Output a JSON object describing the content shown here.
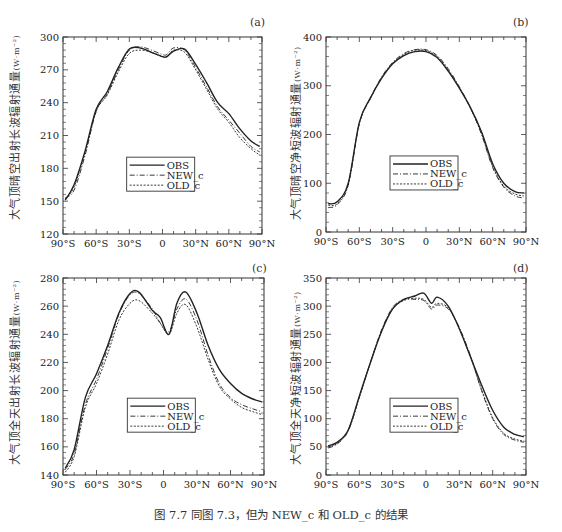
{
  "caption": "图 7.7   同图 7.3，但为 NEW_c 和 OLD_c 的结果",
  "legend": [
    {
      "name": "OBS",
      "style": "solid"
    },
    {
      "name": "NEW_c",
      "style": "dashdot"
    },
    {
      "name": "OLD_c",
      "style": "dashed"
    }
  ],
  "chart_data": [
    {
      "panel": "(a)",
      "type": "line",
      "ylabel": "大气顶晴空出射长波辐射通量",
      "yunit": "(W·m⁻²)",
      "xlabel": "",
      "x": [
        -88,
        -80,
        -70,
        -60,
        -50,
        -40,
        -30,
        -20,
        -10,
        0,
        4,
        10,
        20,
        30,
        40,
        50,
        60,
        70,
        80,
        88
      ],
      "xticks": [
        "90°S",
        "60°S",
        "30°S",
        "0",
        "30°N",
        "60°N",
        "90°N"
      ],
      "ylim": [
        120,
        300
      ],
      "yticks": [
        120,
        150,
        180,
        210,
        240,
        270,
        300
      ],
      "series": [
        {
          "name": "OBS",
          "values": [
            151,
            165,
            196,
            234,
            250,
            272,
            289,
            290,
            286,
            282,
            282,
            287,
            289,
            275,
            258,
            240,
            230,
            216,
            205,
            200
          ]
        },
        {
          "name": "NEW_c",
          "values": [
            153,
            160,
            192,
            232,
            248,
            270,
            288,
            291,
            288,
            284,
            284,
            290,
            288,
            272,
            254,
            236,
            224,
            212,
            200,
            195
          ]
        },
        {
          "name": "OLD_c",
          "values": [
            152,
            163,
            194,
            232,
            247,
            268,
            285,
            288,
            286,
            282,
            282,
            288,
            286,
            270,
            252,
            234,
            222,
            208,
            198,
            192
          ]
        }
      ],
      "legend_position": "center-lower",
      "grid": false
    },
    {
      "panel": "(b)",
      "type": "line",
      "ylabel": "大气顶晴空净短波辐射通量",
      "yunit": "(W·m⁻²)",
      "xlabel": "",
      "x": [
        -88,
        -80,
        -70,
        -60,
        -50,
        -40,
        -30,
        -20,
        -10,
        0,
        10,
        20,
        30,
        40,
        50,
        60,
        70,
        80,
        88
      ],
      "xticks": [
        "90°S",
        "60°S",
        "30°S",
        "0",
        "30°N",
        "60°N",
        "90°N"
      ],
      "ylim": [
        0,
        400
      ],
      "yticks": [
        0,
        100,
        200,
        300,
        400
      ],
      "series": [
        {
          "name": "OBS",
          "values": [
            58,
            62,
            100,
            225,
            275,
            315,
            345,
            362,
            370,
            370,
            358,
            330,
            295,
            255,
            205,
            140,
            100,
            83,
            80
          ]
        },
        {
          "name": "NEW_c",
          "values": [
            50,
            56,
            96,
            222,
            275,
            318,
            348,
            366,
            374,
            374,
            362,
            335,
            298,
            255,
            200,
            132,
            92,
            74,
            70
          ]
        },
        {
          "name": "OLD_c",
          "values": [
            55,
            58,
            98,
            223,
            274,
            316,
            346,
            364,
            373,
            372,
            360,
            332,
            296,
            254,
            202,
            135,
            94,
            78,
            74
          ]
        }
      ],
      "legend_position": "center-lower",
      "grid": false
    },
    {
      "panel": "(c)",
      "type": "line",
      "ylabel": "大气顶全天出射长波辐射通量",
      "yunit": "(W·m⁻²)",
      "xlabel": "",
      "x": [
        -88,
        -80,
        -70,
        -60,
        -50,
        -40,
        -30,
        -22,
        -10,
        -3,
        5,
        12,
        20,
        30,
        40,
        50,
        60,
        70,
        80,
        88
      ],
      "xticks": [
        "90°S",
        "60°S",
        "30°S",
        "0",
        "30°N",
        "60°N",
        "90°N"
      ],
      "ylim": [
        140,
        280
      ],
      "yticks": [
        140,
        160,
        180,
        200,
        220,
        240,
        260,
        280
      ],
      "series": [
        {
          "name": "OBS",
          "values": [
            145,
            158,
            195,
            212,
            232,
            255,
            269,
            270,
            257,
            252,
            240,
            262,
            270,
            255,
            232,
            215,
            205,
            198,
            194,
            192
          ]
        },
        {
          "name": "NEW_c",
          "values": [
            144,
            155,
            190,
            208,
            230,
            254,
            268,
            269,
            258,
            248,
            242,
            258,
            265,
            250,
            225,
            205,
            195,
            190,
            187,
            185
          ]
        },
        {
          "name": "OLD_c",
          "values": [
            142,
            153,
            188,
            205,
            226,
            250,
            262,
            264,
            255,
            248,
            240,
            255,
            261,
            245,
            222,
            203,
            194,
            188,
            185,
            183
          ]
        }
      ],
      "legend_position": "center-lower",
      "grid": false
    },
    {
      "panel": "(d)",
      "type": "line",
      "ylabel": "大气顶全天净短波辐射通量",
      "yunit": "(W·m⁻²)",
      "xlabel": "",
      "x": [
        -88,
        -80,
        -70,
        -60,
        -50,
        -40,
        -30,
        -20,
        -10,
        -2,
        5,
        10,
        20,
        30,
        40,
        50,
        60,
        70,
        80,
        88
      ],
      "xticks": [
        "90°S",
        "60°S",
        "30°S",
        "0",
        "30°N",
        "60°N",
        "90°N"
      ],
      "ylim": [
        0,
        350
      ],
      "yticks": [
        0,
        50,
        100,
        150,
        200,
        250,
        300,
        350
      ],
      "series": [
        {
          "name": "OBS",
          "values": [
            52,
            58,
            80,
            140,
            200,
            255,
            295,
            312,
            318,
            323,
            305,
            316,
            300,
            260,
            210,
            160,
            115,
            85,
            72,
            68
          ]
        },
        {
          "name": "NEW_c",
          "values": [
            48,
            55,
            78,
            138,
            200,
            258,
            298,
            312,
            312,
            310,
            295,
            302,
            295,
            262,
            212,
            150,
            100,
            72,
            62,
            58
          ]
        },
        {
          "name": "OLD_c",
          "values": [
            50,
            56,
            79,
            139,
            200,
            256,
            296,
            310,
            314,
            312,
            298,
            305,
            297,
            260,
            210,
            152,
            102,
            74,
            64,
            60
          ]
        }
      ],
      "legend_position": "center-lower",
      "grid": false
    }
  ]
}
